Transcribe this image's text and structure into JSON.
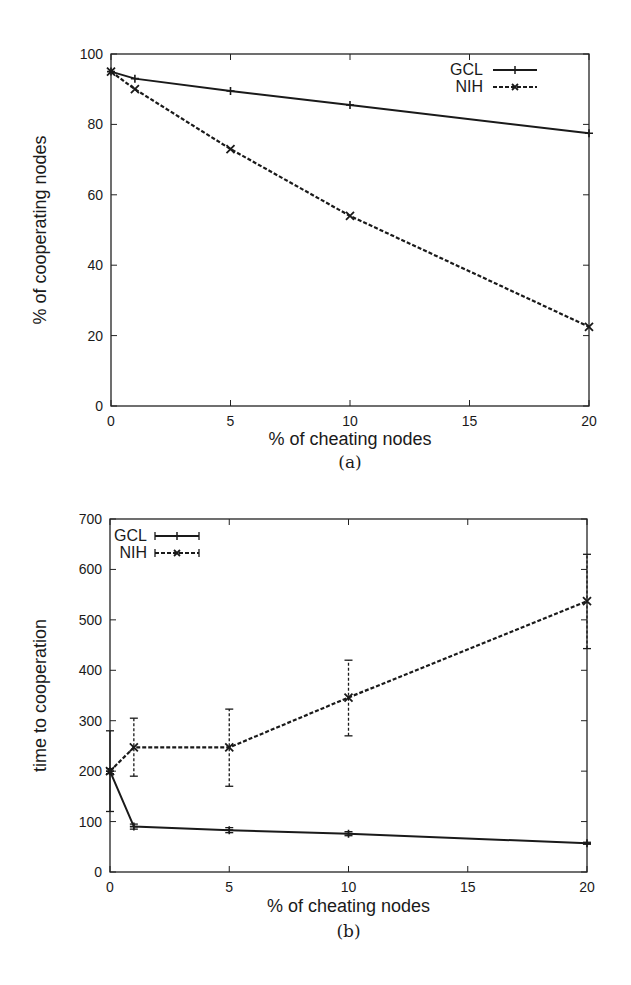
{
  "chart_data": [
    {
      "type": "line",
      "panel": "(a)",
      "caption": "(a)",
      "title": "",
      "xlabel": "% of cheating nodes",
      "ylabel": "% of cooperating nodes",
      "xlim": [
        0,
        20
      ],
      "ylim": [
        0,
        100
      ],
      "xticks": [
        0,
        5,
        10,
        15,
        20
      ],
      "yticks": [
        0,
        20,
        40,
        60,
        80,
        100
      ],
      "grid": false,
      "legend_position": "upper right",
      "x": [
        0,
        1,
        5,
        10,
        20
      ],
      "series": [
        {
          "name": "GCL",
          "style": "solid",
          "marker": "+",
          "values": [
            95,
            93,
            89.5,
            85.5,
            77.5
          ]
        },
        {
          "name": "NIH",
          "style": "dashed",
          "marker": "x",
          "values": [
            95,
            90,
            73,
            54,
            22.5
          ]
        }
      ]
    },
    {
      "type": "line",
      "panel": "(b)",
      "caption": "(b)",
      "title": "",
      "xlabel": "% of cheating nodes",
      "ylabel": "time to cooperation",
      "xlim": [
        0,
        20
      ],
      "ylim": [
        0,
        700
      ],
      "xticks": [
        0,
        5,
        10,
        15,
        20
      ],
      "yticks": [
        0,
        100,
        200,
        300,
        400,
        500,
        600,
        700
      ],
      "grid": false,
      "legend_position": "upper left",
      "error_bars": true,
      "x": [
        0,
        1,
        5,
        10,
        20
      ],
      "series": [
        {
          "name": "GCL",
          "style": "solid",
          "marker": "+",
          "values": [
            200,
            90,
            83,
            76,
            57
          ],
          "err_low": [
            120,
            85,
            78,
            72,
            55
          ],
          "err_high": [
            280,
            95,
            88,
            80,
            59
          ]
        },
        {
          "name": "NIH",
          "style": "dashed",
          "marker": "x",
          "values": [
            200,
            247,
            247,
            346,
            537
          ],
          "err_low": [
            195,
            190,
            170,
            270,
            443
          ],
          "err_high": [
            205,
            305,
            323,
            420,
            630
          ]
        }
      ]
    }
  ]
}
